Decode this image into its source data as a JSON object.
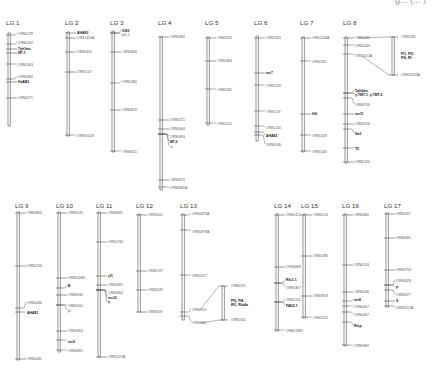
{
  "figure": {
    "top_cropped_text": "g... (... )",
    "linkage_groups": [
      {
        "id": "lg1",
        "label": "LG 1",
        "x": 8,
        "top": 33,
        "bottom": 126,
        "title_y": 25,
        "markers": [
          {
            "y": 35,
            "ty": 34,
            "label": "ORS0228",
            "bold": false
          },
          {
            "y": 44,
            "ty": 43,
            "label": "ORS0202",
            "bold": false
          },
          {
            "y": 49,
            "ty": 48.5,
            "label": "Tph1ms",
            "bold": true
          },
          {
            "y": 53,
            "ty": 53,
            "label": "MT-1",
            "bold": true
          },
          {
            "y": 64,
            "ty": 65,
            "label": "ORS0343",
            "bold": false
          },
          {
            "y": 79,
            "ty": 77,
            "label": "ORS0660",
            "bold": false
          },
          {
            "y": 82,
            "ty": 81.5,
            "label": "HaAB3",
            "bold": true
          },
          {
            "y": 98,
            "ty": 98,
            "label": "ORS0271",
            "bold": false
          }
        ]
      },
      {
        "id": "lg2",
        "label": "LG 2",
        "x": 67,
        "top": 32,
        "bottom": 136,
        "title_y": 25,
        "markers": [
          {
            "y": 33,
            "ty": 33,
            "label": "AHAS3",
            "bold": true
          },
          {
            "y": 38,
            "ty": 38,
            "label": "ORS1411A",
            "bold": false
          },
          {
            "y": 52,
            "ty": 52,
            "label": "ORS0405",
            "bold": false
          },
          {
            "y": 72,
            "ty": 72,
            "label": "ORS1147",
            "bold": false
          },
          {
            "y": 135,
            "ty": 136,
            "label": "ORS01028",
            "bold": false
          }
        ]
      },
      {
        "id": "lg3",
        "label": "LG 3",
        "x": 112,
        "top": 31,
        "bottom": 152,
        "title_y": 25,
        "markers": [
          {
            "y": 33,
            "ty": 31,
            "label": "Ol93",
            "bold": true
          },
          {
            "y": 33,
            "ty": 35,
            "label": "pt5.1",
            "bold": false
          },
          {
            "y": 52,
            "ty": 52,
            "label": "ORS0408",
            "bold": false
          },
          {
            "y": 83,
            "ty": 82,
            "label": "ORS1380",
            "bold": false
          },
          {
            "y": 110,
            "ty": 110,
            "label": "ORS0629",
            "bold": false
          },
          {
            "y": 151,
            "ty": 152,
            "label": "ORS0625",
            "bold": false
          }
        ]
      },
      {
        "id": "lg4",
        "label": "LG 4",
        "x": 160,
        "top": 37,
        "bottom": 190,
        "title_y": 25,
        "markers": [
          {
            "y": 37,
            "ty": 37,
            "label": "ORS0844",
            "bold": false
          },
          {
            "y": 120,
            "ty": 120,
            "label": "ORS0721",
            "bold": false
          },
          {
            "y": 129,
            "ty": 129,
            "label": "ORS1064",
            "bold": false
          },
          {
            "y": 134,
            "ty": 137,
            "label": "ORS0803",
            "bold": false
          },
          {
            "y": 134,
            "ty": 142,
            "label": "MT-2",
            "bold": true
          },
          {
            "y": 134,
            "ty": 147,
            "label": "st",
            "bold": false
          },
          {
            "y": 180,
            "ty": 180,
            "label": "ORS0874",
            "bold": false
          },
          {
            "y": 187,
            "ty": 188,
            "label": "ORS0681A",
            "bold": false
          }
        ]
      },
      {
        "id": "lg5",
        "label": "LG 5",
        "x": 207,
        "top": 37,
        "bottom": 125,
        "title_y": 25,
        "markers": [
          {
            "y": 38,
            "ty": 38,
            "label": "ORS0315",
            "bold": false
          },
          {
            "y": 61,
            "ty": 61,
            "label": "ORS0484",
            "bold": false
          },
          {
            "y": 89,
            "ty": 90,
            "label": "ORS0582",
            "bold": false
          },
          {
            "y": 123,
            "ty": 124,
            "label": "ORS1120",
            "bold": false
          }
        ]
      },
      {
        "id": "lg6",
        "label": "LG 6",
        "x": 256,
        "top": 36,
        "bottom": 141,
        "title_y": 25,
        "markers": [
          {
            "y": 38,
            "ty": 38,
            "label": "ORS1163",
            "bold": false
          },
          {
            "y": 73,
            "ty": 73,
            "label": "ms7",
            "bold": true
          },
          {
            "y": 85,
            "ty": 86,
            "label": "ORS1229",
            "bold": false
          },
          {
            "y": 111,
            "ty": 112,
            "label": "ORS1119",
            "bold": false
          },
          {
            "y": 126,
            "ty": 128,
            "label": "ORS1256",
            "bold": false
          },
          {
            "y": 132,
            "ty": 136,
            "label": "AHAS3",
            "bold": true
          },
          {
            "y": 135,
            "ty": 145,
            "label": "ORS0546",
            "bold": false
          }
        ]
      },
      {
        "id": "lg7",
        "label": "LG 7",
        "x": 302,
        "top": 37,
        "bottom": 152,
        "title_y": 25,
        "markers": [
          {
            "y": 38,
            "ty": 38,
            "label": "ORS1250A",
            "bold": false
          },
          {
            "y": 61,
            "ty": 62,
            "label": "ORS0331",
            "bold": false
          },
          {
            "y": 114,
            "ty": 114,
            "label": "fh5",
            "bold": true
          },
          {
            "y": 135,
            "ty": 136,
            "label": "ORS0328",
            "bold": false
          },
          {
            "y": 151,
            "ty": 152,
            "label": "ORS0140",
            "bold": false
          }
        ]
      },
      {
        "id": "lg8",
        "label": "LG 8",
        "x": 345,
        "top": 37,
        "bottom": 163,
        "title_y": 25,
        "markers": [
          {
            "y": 38,
            "ty": 38,
            "label": "ORS0185",
            "bold": false
          },
          {
            "y": 45,
            "ty": 46,
            "label": "ORS1043",
            "bold": false
          },
          {
            "y": 54,
            "ty": 56,
            "label": "ORS1152A",
            "bold": false
          },
          {
            "y": 93,
            "ty": 91,
            "label": "Tph2ms",
            "bold": true
          },
          {
            "y": 93,
            "ty": 95,
            "label": "γ-TMT-1, γ-TMT-2",
            "bold": true
          },
          {
            "y": 98,
            "ty": 105,
            "label": "ORS0750",
            "bold": false
          },
          {
            "y": 114,
            "ty": 114,
            "label": "ms11",
            "bold": true
          },
          {
            "y": 124,
            "ty": 124,
            "label": "ORS0556",
            "bold": false
          },
          {
            "y": 129,
            "ty": 134,
            "label": "Sa3",
            "bold": true
          },
          {
            "y": 148,
            "ty": 149,
            "label": "T5",
            "bold": true
          },
          {
            "y": 162,
            "ty": 162,
            "label": "ORS0320",
            "bold": false
          }
        ]
      },
      {
        "id": "lg9",
        "label": "LG 9",
        "x": 17,
        "top": 212,
        "bottom": 360,
        "title_y": 208,
        "markers": [
          {
            "y": 213,
            "ty": 213,
            "label": "ORS0803",
            "bold": false
          },
          {
            "y": 266,
            "ty": 266,
            "label": "ORS0256",
            "bold": false
          },
          {
            "y": 308,
            "ty": 303,
            "label": "ORS0444",
            "bold": false
          },
          {
            "y": 312,
            "ty": 313,
            "label": "AHAS1",
            "bold": true
          },
          {
            "y": 359,
            "ty": 359,
            "label": "ORS0442",
            "bold": false
          }
        ]
      },
      {
        "id": "lg10",
        "label": "LG 10",
        "x": 58,
        "top": 212,
        "bottom": 352,
        "title_y": 208,
        "markers": [
          {
            "y": 213,
            "ty": 213,
            "label": "ORS0145",
            "bold": false
          },
          {
            "y": 278,
            "ty": 278,
            "label": "ORS01086",
            "bold": false
          },
          {
            "y": 288,
            "ty": 286,
            "label": "B",
            "bold": true
          },
          {
            "y": 295,
            "ty": 295,
            "label": "ORS0930",
            "bold": false
          },
          {
            "y": 305,
            "ty": 306,
            "label": "ORS0502",
            "bold": false
          },
          {
            "y": 305,
            "ty": 311,
            "label": "pl",
            "bold": false
          },
          {
            "y": 331,
            "ty": 331,
            "label": "ORS0853",
            "bold": false
          },
          {
            "y": 340,
            "ty": 342,
            "label": "ms9",
            "bold": true
          },
          {
            "y": 350,
            "ty": 351,
            "label": "ORS0891",
            "bold": false
          }
        ]
      },
      {
        "id": "lg11",
        "label": "LG 11",
        "x": 98,
        "top": 212,
        "bottom": 357,
        "title_y": 208,
        "markers": [
          {
            "y": 213,
            "ty": 213,
            "label": "ORS0831",
            "bold": false
          },
          {
            "y": 242,
            "ty": 242,
            "label": "ORS0733",
            "bold": false
          },
          {
            "y": 276,
            "ty": 276,
            "label": "yf1",
            "bold": true
          },
          {
            "y": 285,
            "ty": 285,
            "label": "ORS0499",
            "bold": false
          },
          {
            "y": 290,
            "ty": 293,
            "label": "ORS0664",
            "bold": false
          },
          {
            "y": 290,
            "ty": 298,
            "label": "ms10",
            "bold": true
          },
          {
            "y": 290,
            "ty": 303,
            "label": "T",
            "bold": true
          },
          {
            "y": 357,
            "ty": 357,
            "label": "ORS1147A",
            "bold": false
          }
        ]
      },
      {
        "id": "lg12",
        "label": "LG 12",
        "x": 138,
        "top": 214,
        "bottom": 312,
        "title_y": 208,
        "markers": [
          {
            "y": 215,
            "ty": 215,
            "label": "ORS0502",
            "bold": false
          },
          {
            "y": 271,
            "ty": 271,
            "label": "ORS0747",
            "bold": false
          },
          {
            "y": 290,
            "ty": 290,
            "label": "ORS0539",
            "bold": false
          },
          {
            "y": 312,
            "ty": 312,
            "label": "ORS0637",
            "bold": false
          }
        ]
      },
      {
        "id": "lg13",
        "label": "LG 13",
        "x": 182,
        "top": 214,
        "bottom": 320,
        "title_y": 208,
        "markers": [
          {
            "y": 215,
            "ty": 214,
            "label": "ORS0873A",
            "bold": false
          },
          {
            "y": 230,
            "ty": 232,
            "label": "ORS0878A",
            "bold": false
          },
          {
            "y": 275,
            "ty": 276,
            "label": "ORS0317",
            "bold": false
          },
          {
            "y": 312,
            "ty": 310,
            "label": "ORS0191",
            "bold": false
          },
          {
            "y": 316,
            "ty": 323,
            "label": "ORS0561",
            "bold": false
          }
        ]
      },
      {
        "id": "lg14",
        "label": "LG 14",
        "x": 276,
        "top": 214,
        "bottom": 331,
        "title_y": 208,
        "markers": [
          {
            "y": 215,
            "ty": 215,
            "label": "ORS0124",
            "bold": false
          },
          {
            "y": 267,
            "ty": 267,
            "label": "ORS0668",
            "bold": false
          },
          {
            "y": 283,
            "ty": 280,
            "label": "Rfo1-1",
            "bold": true
          },
          {
            "y": 283,
            "ty": 288,
            "label": "ORS0307",
            "bold": false
          },
          {
            "y": 302,
            "ty": 300,
            "label": "ORS1150",
            "bold": false
          },
          {
            "y": 302,
            "ty": 306,
            "label": "FAD2-1",
            "bold": true
          },
          {
            "y": 330,
            "ty": 331,
            "label": "ORS01380",
            "bold": false
          }
        ]
      },
      {
        "id": "lg15",
        "label": "LG 15",
        "x": 303,
        "top": 214,
        "bottom": 318,
        "title_y": 208,
        "markers": [
          {
            "y": 215,
            "ty": 215,
            "label": "ORS0513",
            "bold": false
          },
          {
            "y": 256,
            "ty": 256,
            "label": "ORS0284",
            "bold": false
          },
          {
            "y": 296,
            "ty": 296,
            "label": "ORS0858",
            "bold": false
          },
          {
            "y": 317,
            "ty": 318,
            "label": "ORS1215",
            "bold": false
          }
        ]
      },
      {
        "id": "lg16",
        "label": "LG 16",
        "x": 344,
        "top": 214,
        "bottom": 346,
        "title_y": 208,
        "markers": [
          {
            "y": 215,
            "ty": 215,
            "label": "ORS0840",
            "bold": false
          },
          {
            "y": 265,
            "ty": 265,
            "label": "ORS0243",
            "bold": false
          },
          {
            "y": 292,
            "ty": 292,
            "label": "ORS0038",
            "bold": false
          },
          {
            "y": 301,
            "ty": 300,
            "label": "ms8",
            "bold": true
          },
          {
            "y": 306,
            "ty": 307,
            "label": "ORS0607",
            "bold": false
          },
          {
            "y": 312,
            "ty": 315,
            "label": "ORS0407",
            "bold": false
          },
          {
            "y": 322,
            "ty": 326,
            "label": "Rtsp",
            "bold": true
          },
          {
            "y": 345,
            "ty": 346,
            "label": "ORS0849",
            "bold": false
          }
        ]
      },
      {
        "id": "lg17",
        "label": "LG 17",
        "x": 386,
        "top": 213,
        "bottom": 307,
        "title_y": 208,
        "markers": [
          {
            "y": 214,
            "ty": 214,
            "label": "ORS0567",
            "bold": false
          },
          {
            "y": 238,
            "ty": 238,
            "label": "ORS0065",
            "bold": false
          },
          {
            "y": 270,
            "ty": 270,
            "label": "ORS0758",
            "bold": false
          },
          {
            "y": 285,
            "ty": 281,
            "label": "ORS0628",
            "bold": false
          },
          {
            "y": 285,
            "ty": 288,
            "label": "P",
            "bold": true
          },
          {
            "y": 290,
            "ty": 295,
            "label": "ORS0677",
            "bold": false
          },
          {
            "y": 301,
            "ty": 301,
            "label": "S",
            "bold": true
          },
          {
            "y": 306,
            "ty": 308,
            "label": "ORS0512A",
            "bold": false
          }
        ]
      }
    ],
    "insets": [
      {
        "id": "lg8-inset",
        "x": 392,
        "top": 37,
        "bottom": 75,
        "top_label": "ORS0185",
        "bottom_label": "ORS01152A",
        "bold_lines": [
          "Pl1, Pl2,",
          "Pl6, Rl"
        ],
        "connect_from_top": {
          "x": 358,
          "y": 38
        },
        "connect_from_bottom": {
          "x": 362,
          "y": 56
        }
      },
      {
        "id": "lg13-inset",
        "x": 222,
        "top": 286,
        "bottom": 320,
        "top_label": "ORS0191",
        "bottom_label": "ORS0561",
        "bold_lines": [
          "Pl5, Pl8,",
          "Rf1, Rfo4a"
        ],
        "connect_from_top": {
          "x": 200,
          "y": 310
        },
        "connect_from_bottom": {
          "x": 200,
          "y": 323
        }
      }
    ]
  }
}
